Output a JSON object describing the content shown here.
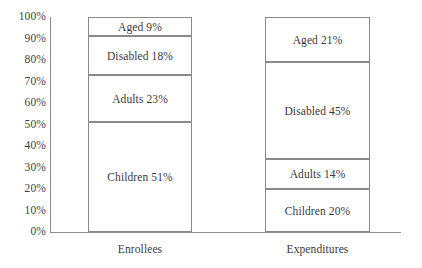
{
  "chart_data": {
    "type": "bar",
    "subtype": "stacked-bar-100-percent",
    "title": "",
    "subtitle": "",
    "xlabel": "",
    "ylabel": "",
    "categories": [
      "Enrollees",
      "Expenditures"
    ],
    "ylim": [
      0,
      100
    ],
    "y_tick_labels": [
      "100%",
      "90%",
      "80%",
      "70%",
      "60%",
      "50%",
      "40%",
      "30%",
      "20%",
      "10%",
      "0%"
    ],
    "y_tick_values": [
      100,
      90,
      80,
      70,
      60,
      50,
      40,
      30,
      20,
      10,
      0
    ],
    "grid": false,
    "legend": "none",
    "stack_order_bottom_to_top": [
      "Children",
      "Adults",
      "Disabled",
      "Aged"
    ],
    "series": [
      {
        "name": "Children",
        "values": [
          51,
          20
        ]
      },
      {
        "name": "Adults",
        "values": [
          23,
          14
        ]
      },
      {
        "name": "Disabled",
        "values": [
          18,
          45
        ]
      },
      {
        "name": "Aged",
        "values": [
          9,
          21
        ]
      }
    ],
    "bars": [
      {
        "category": "Enrollees",
        "segments": [
          {
            "name": "Aged",
            "value": 9,
            "label": "Aged 9%",
            "start": 91,
            "end": 100
          },
          {
            "name": "Disabled",
            "value": 18,
            "label": "Disabled 18%",
            "start": 73,
            "end": 91
          },
          {
            "name": "Adults",
            "value": 23,
            "label": "Adults 23%",
            "start": 51,
            "end": 73
          },
          {
            "name": "Children",
            "value": 51,
            "label": "Children 51%",
            "start": 0,
            "end": 51
          }
        ]
      },
      {
        "category": "Expenditures",
        "segments": [
          {
            "name": "Aged",
            "value": 21,
            "label": "Aged 21%",
            "start": 79,
            "end": 100
          },
          {
            "name": "Disabled",
            "value": 45,
            "label": "Disabled 45%",
            "start": 34,
            "end": 79
          },
          {
            "name": "Adults",
            "value": 14,
            "label": "Adults 14%",
            "start": 20,
            "end": 34
          },
          {
            "name": "Children",
            "value": 20,
            "label": "Children 20%",
            "start": 0,
            "end": 20
          }
        ]
      }
    ],
    "colors": {
      "background": "#ffffff",
      "bar_fill": "#ffffff",
      "bar_stroke": "#8a8a8a",
      "axis": "#8d8d8d",
      "text": "#3a3a3a"
    }
  }
}
